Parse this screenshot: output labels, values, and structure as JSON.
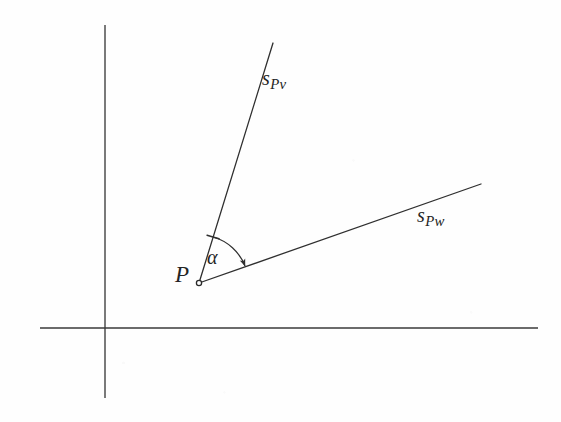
{
  "figure": {
    "type": "geometry-diagram",
    "background_color": "#fefefe",
    "ink_color": "#333333",
    "text_color": "#242424",
    "width": 561,
    "height": 422
  },
  "axes": {
    "vertical": {
      "name": "vertical-axis",
      "x": 105,
      "y_top": 25,
      "y_bottom": 398
    },
    "horizontal": {
      "name": "horizontal-axis",
      "y": 328,
      "x_left": 40,
      "x_right": 538
    }
  },
  "vertex": {
    "label": "P",
    "x": 199,
    "y": 283,
    "marker": "open-circle",
    "marker_radius": 2.6
  },
  "rays": [
    {
      "id": "ray-spv",
      "label_base": "s",
      "label_sub": "Pv",
      "from_x": 199,
      "from_y": 283,
      "to_x": 273,
      "to_y": 43,
      "label_x": 262,
      "label_y": 68
    },
    {
      "id": "ray-spw",
      "label_base": "s",
      "label_sub": "Pw",
      "from_x": 199,
      "from_y": 283,
      "to_x": 481,
      "to_y": 184,
      "label_x": 417,
      "label_y": 205
    }
  ],
  "angle_arc": {
    "label": "α",
    "center_x": 199,
    "center_y": 283,
    "radius": 48,
    "start_x": 213,
    "start_y": 237,
    "end_x": 245,
    "end_y": 266,
    "start_cap": "tick",
    "end_cap": "arrowhead",
    "label_x": 207,
    "label_y": 247
  }
}
